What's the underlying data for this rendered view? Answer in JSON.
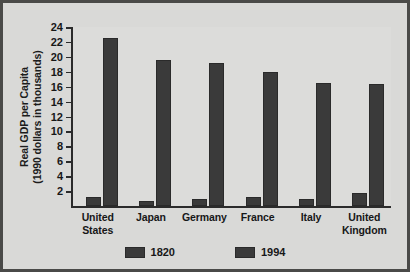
{
  "chart_data": {
    "type": "bar",
    "title": "",
    "xlabel": "",
    "ylabel_line1": "Real GDP per Capita",
    "ylabel_line2": "(1990 dollars in thousands)",
    "categories": [
      "United States",
      "Japan",
      "Germany",
      "France",
      "Italy",
      "United Kingdom"
    ],
    "categories_wrapped": [
      [
        "United",
        "States"
      ],
      [
        "Japan",
        ""
      ],
      [
        "Germany",
        ""
      ],
      [
        "France",
        ""
      ],
      [
        "Italy",
        ""
      ],
      [
        "United",
        "Kingdom"
      ]
    ],
    "series": [
      {
        "name": "1820",
        "values": [
          1.2,
          0.7,
          1.0,
          1.2,
          1.0,
          1.7
        ]
      },
      {
        "name": "1994",
        "values": [
          22.5,
          19.6,
          19.2,
          18.0,
          16.5,
          16.4
        ]
      }
    ],
    "ylim": [
      0,
      24
    ],
    "ytick_labels": [
      "24",
      "22",
      "20",
      "18",
      "16",
      "14",
      "12",
      "10",
      "8",
      "6",
      "4",
      "2"
    ],
    "ytick_values": [
      24,
      22,
      20,
      18,
      16,
      14,
      12,
      10,
      8,
      6,
      4,
      2
    ],
    "grid": false,
    "legend_position": "bottom",
    "legend_entries": [
      "1820",
      "1994"
    ],
    "bar_color": "#3a3a3a",
    "plot_background": "#dcdcda",
    "figure_background": "#d9d9d7",
    "axis_color": "#2b2b2b"
  }
}
